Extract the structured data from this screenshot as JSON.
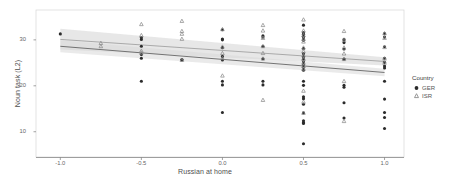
{
  "chart_data": {
    "type": "scatter",
    "title": "",
    "xlabel": "Russian at home",
    "ylabel": "Noun task (L2)",
    "xlim": [
      -1.15,
      1.12
    ],
    "ylim": [
      4.5,
      36.5
    ],
    "xticks": [
      -1.0,
      -0.5,
      0.0,
      0.5,
      1.0
    ],
    "xticklabels": [
      "-1.0",
      "-0.5",
      "0.0",
      "0.5",
      "1.0"
    ],
    "yticks": [
      10,
      20,
      30
    ],
    "yticklabels": [
      "10",
      "20",
      "30"
    ],
    "grid": false,
    "legend": {
      "title": "Country",
      "position": "right",
      "entries": [
        {
          "label": "GER",
          "marker": "circle",
          "color": "#2b2b2b"
        },
        {
          "label": "ISR",
          "marker": "triangle",
          "color": "#8c8c8c"
        }
      ]
    },
    "series": [
      {
        "name": "GER",
        "marker": "circle",
        "color": "#2b2b2b",
        "points": [
          [
            -1.0,
            31.3
          ],
          [
            -0.5,
            30.5
          ],
          [
            -0.5,
            30.1
          ],
          [
            -0.5,
            28.6
          ],
          [
            -0.5,
            26.8
          ],
          [
            -0.5,
            26.0
          ],
          [
            -0.5,
            21.0
          ],
          [
            -0.25,
            25.7
          ],
          [
            -0.25,
            25.6
          ],
          [
            0.0,
            32.2
          ],
          [
            0.0,
            30.2
          ],
          [
            0.0,
            30.0
          ],
          [
            0.0,
            28.3
          ],
          [
            0.0,
            26.4
          ],
          [
            0.0,
            25.6
          ],
          [
            0.0,
            21.0
          ],
          [
            0.0,
            20.2
          ],
          [
            0.0,
            14.2
          ],
          [
            0.25,
            30.9
          ],
          [
            0.25,
            30.6
          ],
          [
            0.25,
            28.6
          ],
          [
            0.25,
            25.9
          ],
          [
            0.25,
            21.0
          ],
          [
            0.25,
            20.2
          ],
          [
            0.5,
            33.2
          ],
          [
            0.5,
            31.6
          ],
          [
            0.5,
            31.2
          ],
          [
            0.5,
            30.8
          ],
          [
            0.5,
            30.4
          ],
          [
            0.5,
            29.9
          ],
          [
            0.5,
            28.1
          ],
          [
            0.5,
            27.0
          ],
          [
            0.5,
            26.3
          ],
          [
            0.5,
            25.8
          ],
          [
            0.5,
            25.2
          ],
          [
            0.5,
            24.6
          ],
          [
            0.5,
            24.0
          ],
          [
            0.5,
            23.4
          ],
          [
            0.5,
            21.0
          ],
          [
            0.5,
            20.1
          ],
          [
            0.5,
            17.6
          ],
          [
            0.5,
            17.2
          ],
          [
            0.5,
            16.0
          ],
          [
            0.5,
            14.1
          ],
          [
            0.5,
            12.4
          ],
          [
            0.5,
            12.0
          ],
          [
            0.5,
            11.8
          ],
          [
            0.5,
            7.4
          ],
          [
            0.75,
            30.1
          ],
          [
            0.75,
            29.4
          ],
          [
            0.75,
            28.0
          ],
          [
            0.75,
            25.8
          ],
          [
            0.75,
            20.1
          ],
          [
            0.75,
            19.7
          ],
          [
            0.75,
            16.3
          ],
          [
            0.75,
            13.0
          ],
          [
            1.0,
            31.4
          ],
          [
            1.0,
            30.6
          ],
          [
            1.0,
            28.5
          ],
          [
            1.0,
            26.0
          ],
          [
            1.0,
            25.1
          ],
          [
            1.0,
            24.3
          ],
          [
            1.0,
            23.9
          ],
          [
            1.0,
            21.0
          ],
          [
            1.0,
            17.1
          ],
          [
            1.0,
            14.2
          ],
          [
            1.0,
            13.1
          ],
          [
            1.0,
            10.7
          ]
        ]
      },
      {
        "name": "ISR",
        "marker": "triangle",
        "color": "#8c8c8c",
        "points": [
          [
            -0.75,
            29.3
          ],
          [
            -0.75,
            28.6
          ],
          [
            -0.5,
            33.4
          ],
          [
            -0.5,
            31.0
          ],
          [
            -0.5,
            27.6
          ],
          [
            -0.5,
            27.2
          ],
          [
            -0.25,
            34.1
          ],
          [
            -0.25,
            31.9
          ],
          [
            -0.25,
            31.3
          ],
          [
            -0.25,
            30.2
          ],
          [
            -0.25,
            25.6
          ],
          [
            0.0,
            32.3
          ],
          [
            0.0,
            28.5
          ],
          [
            0.0,
            27.1
          ],
          [
            0.0,
            26.0
          ],
          [
            0.0,
            22.2
          ],
          [
            0.25,
            33.2
          ],
          [
            0.25,
            32.0
          ],
          [
            0.25,
            30.4
          ],
          [
            0.25,
            28.6
          ],
          [
            0.25,
            27.1
          ],
          [
            0.25,
            25.9
          ],
          [
            0.25,
            16.9
          ],
          [
            0.5,
            34.4
          ],
          [
            0.5,
            32.0
          ],
          [
            0.5,
            31.0
          ],
          [
            0.5,
            30.2
          ],
          [
            0.5,
            29.6
          ],
          [
            0.5,
            28.3
          ],
          [
            0.5,
            27.5
          ],
          [
            0.5,
            26.6
          ],
          [
            0.5,
            25.8
          ],
          [
            0.5,
            25.0
          ],
          [
            0.5,
            24.3
          ],
          [
            0.5,
            23.7
          ],
          [
            0.5,
            18.9
          ],
          [
            0.5,
            16.5
          ],
          [
            0.5,
            14.1
          ],
          [
            0.75,
            31.9
          ],
          [
            0.75,
            30.0
          ],
          [
            0.75,
            28.3
          ],
          [
            0.75,
            27.0
          ],
          [
            0.75,
            25.8
          ],
          [
            0.75,
            21.0
          ],
          [
            0.75,
            12.3
          ],
          [
            1.0,
            31.4
          ],
          [
            1.0,
            30.4
          ],
          [
            1.0,
            28.4
          ],
          [
            1.0,
            25.9
          ],
          [
            1.0,
            25.0
          ]
        ]
      }
    ],
    "fits": [
      {
        "name": "ISR",
        "color": "#999999",
        "band_color": "#d4d4d4",
        "x0": -1.0,
        "y0": 30.1,
        "x1": 1.0,
        "y1": 25.3,
        "band0_lo": 27.9,
        "band0_hi": 32.4,
        "band1_lo": 24.4,
        "band1_hi": 26.2
      },
      {
        "name": "GER",
        "color": "#555555",
        "band_color": "#d9d9d9",
        "x0": -1.0,
        "y0": 28.6,
        "x1": 1.0,
        "y1": 22.9,
        "band0_lo": 27.3,
        "band0_hi": 29.9,
        "band1_lo": 22.1,
        "band1_hi": 23.7
      }
    ]
  },
  "axis": {
    "x_title": "Russian at home",
    "y_title": "Noun task (L2)"
  },
  "legend": {
    "title": "Country",
    "items": [
      {
        "label": "GER"
      },
      {
        "label": "ISR"
      }
    ]
  }
}
